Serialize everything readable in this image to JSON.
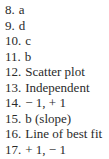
{
  "answers": [
    {
      "number": "8.",
      "text": "a"
    },
    {
      "number": "9.",
      "text": "d"
    },
    {
      "number": "10.",
      "text": "c"
    },
    {
      "number": "11.",
      "text": "b"
    },
    {
      "number": "12.",
      "text": "Scatter plot"
    },
    {
      "number": "13.",
      "text": "Independent"
    },
    {
      "number": "14.",
      "text": "− 1, + 1"
    },
    {
      "number": "15.",
      "text": "b (slope)"
    },
    {
      "number": "16.",
      "text": "Line of best fit"
    },
    {
      "number": "17.",
      "text": "+ 1, − 1"
    }
  ]
}
